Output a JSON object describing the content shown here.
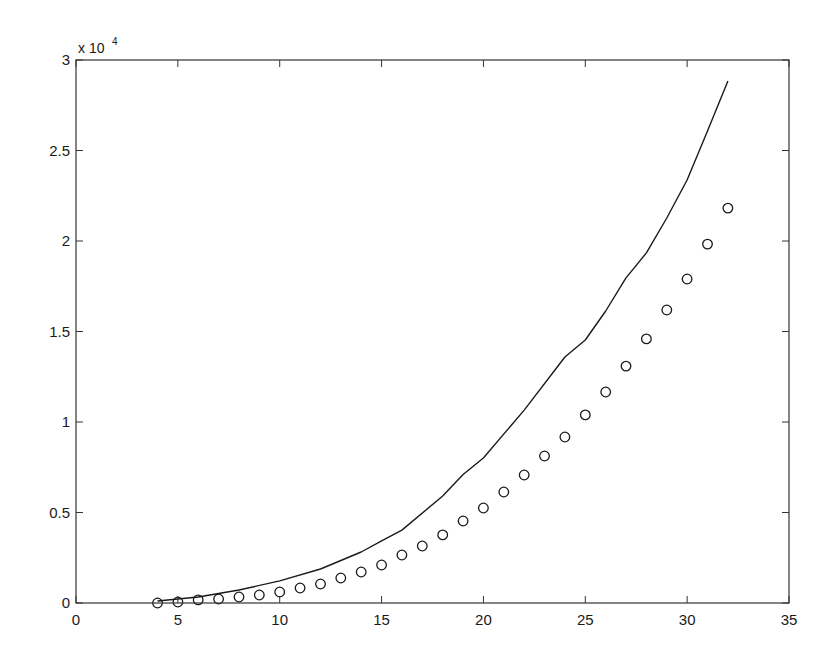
{
  "chart_data": {
    "type": "line",
    "title": "",
    "xlabel": "",
    "ylabel": "",
    "xlim": [
      0,
      35
    ],
    "ylim": [
      0,
      30000
    ],
    "grid": false,
    "legend": null,
    "y_exponent_label": "x 10",
    "y_exponent_power": "4",
    "x_ticks": [
      0,
      5,
      10,
      15,
      20,
      25,
      30,
      35
    ],
    "x_tick_labels": [
      "0",
      "5",
      "10",
      "15",
      "20",
      "25",
      "30",
      "35"
    ],
    "y_ticks": [
      0,
      5000,
      10000,
      15000,
      20000,
      25000,
      30000
    ],
    "y_tick_labels": [
      "0",
      "0.5",
      "1",
      "1.5",
      "2",
      "2.5",
      "3"
    ],
    "series": [
      {
        "name": "line",
        "style": "solid-line",
        "color": "#1a1a1a",
        "x": [
          4,
          6,
          8,
          10,
          12,
          14,
          15,
          16,
          18,
          19,
          20,
          22,
          24,
          25,
          26,
          27,
          28,
          29,
          30,
          31,
          32
        ],
        "values": [
          110,
          330,
          720,
          1220,
          1880,
          2820,
          3430,
          4030,
          5910,
          7100,
          8010,
          10660,
          13590,
          14530,
          16130,
          17960,
          19340,
          21270,
          23370,
          26080,
          28840
        ]
      },
      {
        "name": "circles",
        "style": "open-circle-markers",
        "color": "#1a1a1a",
        "x": [
          4,
          5,
          6,
          7,
          8,
          9,
          10,
          11,
          12,
          13,
          14,
          15,
          16,
          17,
          18,
          19,
          20,
          21,
          22,
          23,
          24,
          25,
          26,
          27,
          28,
          29,
          30,
          31,
          32
        ],
        "values": [
          0,
          55,
          170,
          220,
          330,
          440,
          610,
          830,
          1050,
          1380,
          1710,
          2100,
          2650,
          3150,
          3760,
          4530,
          5250,
          6130,
          7070,
          8120,
          9170,
          10390,
          11660,
          13090,
          14590,
          16190,
          17900,
          19830,
          21820
        ]
      }
    ],
    "plot_area": {
      "left": 76,
      "top": 60,
      "right": 789,
      "bottom": 603
    }
  }
}
